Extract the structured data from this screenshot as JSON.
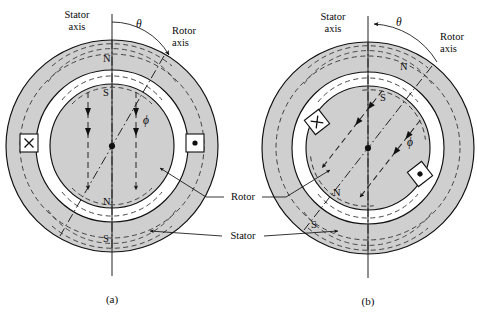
{
  "figure": {
    "captions": {
      "left": "(a)",
      "right": "(b)"
    },
    "shared_labels": {
      "rotor": "Rotor",
      "stator": "Stator"
    },
    "colors": {
      "iron": "#cfcfcf",
      "line": "#111111",
      "gap": "#ffffff",
      "dash": "#333333"
    }
  },
  "panels": [
    {
      "id": "a",
      "caption": "(a)",
      "axis_labels": {
        "stator_axis_line1": "Stator",
        "stator_axis_line2": "axis",
        "rotor_axis_line1": "Rotor",
        "rotor_axis_line2": "axis"
      },
      "angle_symbol": "θ",
      "flux_symbol": "ϕ",
      "rotor_angle_deg": 30,
      "poles": [
        {
          "label": "N",
          "where": "stator-top"
        },
        {
          "label": "S",
          "where": "rotor-top"
        },
        {
          "label": "N",
          "where": "rotor-bottom"
        },
        {
          "label": "S",
          "where": "stator-bottom"
        }
      ],
      "coil_markers": [
        {
          "symbol": "×",
          "side": "left",
          "name": "current-into-page"
        },
        {
          "symbol": "•",
          "side": "right",
          "name": "current-out-of-page"
        }
      ],
      "flux_direction": "vertical-downward"
    },
    {
      "id": "b",
      "caption": "(b)",
      "axis_labels": {
        "stator_axis_line1": "Stator",
        "stator_axis_line2": "axis",
        "rotor_axis_line1": "Rotor",
        "rotor_axis_line2": "axis"
      },
      "angle_symbol": "θ",
      "flux_symbol": "ϕ",
      "rotor_angle_deg": 38,
      "poles": [
        {
          "label": "N",
          "where": "stator-upper-right"
        },
        {
          "label": "S",
          "where": "rotor-upper-right"
        },
        {
          "label": "N",
          "where": "rotor-lower-left"
        },
        {
          "label": "S",
          "where": "stator-lower-left"
        }
      ],
      "coil_markers": [
        {
          "symbol": "×",
          "side": "upper-left",
          "name": "current-into-page"
        },
        {
          "symbol": "•",
          "side": "lower-right",
          "name": "current-out-of-page"
        }
      ],
      "flux_direction": "tilted-parallel-to-rotor-axis"
    }
  ]
}
